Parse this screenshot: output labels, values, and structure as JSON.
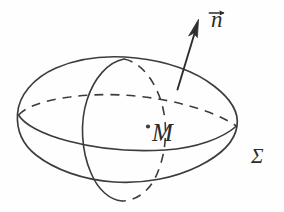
{
  "figure": {
    "caption_title": "",
    "style": "pencil line drawing",
    "background_color": "#fefefe",
    "ink_color": "#3a3a3a",
    "labels": {
      "normal_vector": "n",
      "normal_vector_accent": "vector-arrow",
      "point": "M",
      "surface": "Σ"
    },
    "icon_names": {
      "normal_arrow": "arrow-up-right-icon",
      "vector_accent": "vector-arrow-accent-icon",
      "point_marker": "point-dot-icon"
    },
    "geometry": {
      "outer_ellipse": {
        "cx": 127,
        "cy": 120,
        "rx": 110,
        "ry": 62,
        "rotation_deg": -4,
        "stroke": "solid"
      },
      "equator_ellipse": {
        "cx": 127,
        "cy": 122,
        "rx": 110,
        "ry": 28,
        "rotation_deg": -4,
        "front_stroke": "solid",
        "back_stroke": "dashed"
      },
      "meridian_ellipse": {
        "cx": 123,
        "cy": 130,
        "rx": 42,
        "ry": 70,
        "rotation_deg": 2,
        "front_stroke": "solid",
        "back_stroke": "dashed"
      },
      "point_M": {
        "x": 148,
        "y": 126
      },
      "normal_arrow": {
        "from_x": 178,
        "from_y": 89,
        "to_x": 198,
        "to_y": 20
      }
    }
  }
}
